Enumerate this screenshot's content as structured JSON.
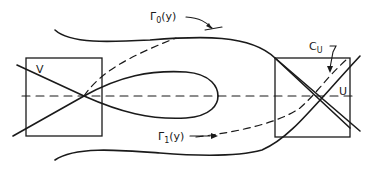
{
  "diagram": {
    "type": "phase-portrait",
    "colors": {
      "stroke": "#1a1a1a",
      "background": "#ffffff"
    },
    "labels": {
      "gamma0": {
        "base": "Γ",
        "sub": "0",
        "arg": "(y)"
      },
      "gamma1": {
        "base": "Γ",
        "sub": "1",
        "arg": "(y)"
      },
      "cu": {
        "base": "C",
        "sub": "U"
      },
      "v": "V",
      "u": "U"
    },
    "regions": [
      {
        "name": "V",
        "role": "left saddle neighborhood"
      },
      {
        "name": "U",
        "role": "right saddle neighborhood"
      }
    ]
  }
}
